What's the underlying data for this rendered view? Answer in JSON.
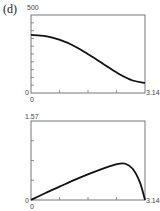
{
  "panel_label": "(d)",
  "chart_data": [
    {
      "type": "line",
      "title": "",
      "xlabel": "",
      "ylabel": "",
      "xlim": [
        0,
        3.14
      ],
      "ylim": [
        0,
        500
      ],
      "x_tick_labels": [
        "0",
        "3.14"
      ],
      "y_tick_labels": [
        "0",
        "500"
      ],
      "grid": false,
      "x": [
        0,
        0.4,
        0.8,
        1.2,
        1.6,
        2.0,
        2.4,
        2.8,
        3.14
      ],
      "series": [
        {
          "name": "curve",
          "values": [
            372,
            365,
            340,
            300,
            245,
            185,
            125,
            80,
            65
          ]
        }
      ]
    },
    {
      "type": "line",
      "title": "",
      "xlabel": "",
      "ylabel": "",
      "xlim": [
        0,
        3.14
      ],
      "ylim": [
        0,
        1.57
      ],
      "x_tick_labels": [
        "0",
        "3.14"
      ],
      "y_tick_labels": [
        "0",
        "1.57"
      ],
      "grid": false,
      "x": [
        0,
        0.4,
        0.8,
        1.2,
        1.6,
        2.0,
        2.4,
        2.6,
        2.8,
        3.0,
        3.14
      ],
      "series": [
        {
          "name": "curve",
          "values": [
            0,
            0.14,
            0.27,
            0.4,
            0.52,
            0.63,
            0.72,
            0.72,
            0.62,
            0.35,
            0
          ]
        }
      ]
    }
  ],
  "labels": {
    "top": {
      "ymax": "500",
      "ymin": "0",
      "xmin": "0",
      "xmax": "3.14"
    },
    "bottom": {
      "ymax": "1.57",
      "ymin": "0",
      "xmin": "0",
      "xmax": "3.14"
    }
  }
}
